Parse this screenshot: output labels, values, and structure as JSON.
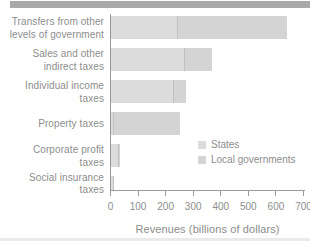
{
  "figure": {
    "top_rule": "figure header rule",
    "bottom_rule": "cropped page element"
  },
  "chart_data": {
    "type": "bar",
    "orientation": "horizontal",
    "stacked": true,
    "title": "",
    "xlabel": "Revenues (billions of dollars)",
    "ylabel": "",
    "xlim": [
      0,
      700
    ],
    "x_ticks": [
      "0",
      "100",
      "200",
      "300",
      "400",
      "500",
      "600",
      "700"
    ],
    "grid": false,
    "legend_position": "inside-right",
    "categories": [
      "Transfers from other levels of government",
      "Sales and other indirect taxes",
      "Individual income taxes",
      "Property taxes",
      "Corporate profit taxes",
      "Social insurance taxes"
    ],
    "category_label_lines": [
      [
        "Transfers from other",
        "levels of government"
      ],
      [
        "Sales and other",
        "indirect taxes"
      ],
      [
        "Individual income",
        "taxes"
      ],
      [
        "Property taxes"
      ],
      [
        "Corporate profit",
        "taxes"
      ],
      [
        "Social insurance",
        "taxes"
      ]
    ],
    "series": [
      {
        "name": "States",
        "color": "#dcdcdc",
        "values": [
          240,
          265,
          225,
          10,
          27,
          8
        ]
      },
      {
        "name": "Local governments",
        "color": "#d4d4d4",
        "values": [
          395,
          100,
          45,
          240,
          5,
          2
        ]
      }
    ],
    "totals": [
      635,
      365,
      270,
      250,
      32,
      10
    ]
  },
  "colors": {
    "axis": "#9a9a9a",
    "text": "#8d8d8d",
    "segment_divider": "#c0c0c0",
    "top_rule": "#a9a9a9",
    "bottom_rule": "#eaeaea"
  }
}
